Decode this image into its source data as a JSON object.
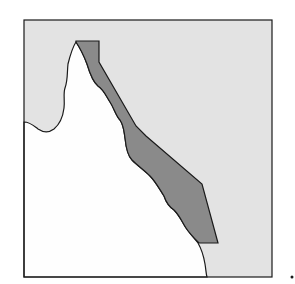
{
  "map": {
    "title": "Great Barrier Reef region, Queensland coast",
    "regions": [
      {
        "name": "sea",
        "fill": "#e3e3e3"
      },
      {
        "name": "land",
        "fill": "#fefefe"
      },
      {
        "name": "reef-zone",
        "fill": "#8a8a8a"
      }
    ],
    "colors": {
      "sea": "#e3e3e3",
      "land": "#fefefe",
      "reef": "#8a8a8a",
      "outline": "#1a1a1a"
    },
    "marker": "·"
  }
}
